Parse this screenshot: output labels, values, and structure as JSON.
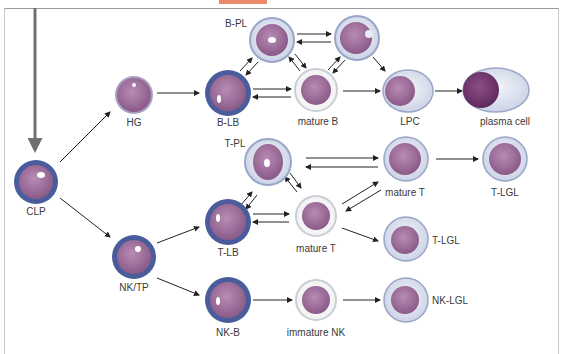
{
  "figure": {
    "accent_color": "#e98a6a",
    "caption_partial": "… B-PL, T-…"
  },
  "cells": {
    "clp": {
      "label": "CLP"
    },
    "hg": {
      "label": "HG"
    },
    "nktp": {
      "label": "NK/TP"
    },
    "b_pl": {
      "label": "B-PL"
    },
    "b_unlabeled": {
      "label": ""
    },
    "b_lb": {
      "label": "B-LB"
    },
    "mature_b": {
      "label": "mature B"
    },
    "lpc": {
      "label": "LPC"
    },
    "plasma_cell": {
      "label": "plasma cell"
    },
    "t_pl": {
      "label": "T-PL"
    },
    "mature_t_upper": {
      "label": "mature T"
    },
    "t_lgl_upper": {
      "label": "T-LGL"
    },
    "t_lb": {
      "label": "T-LB"
    },
    "mature_t_mid": {
      "label": "mature T"
    },
    "t_lgl_mid": {
      "label": "T-LGL"
    },
    "nk_b": {
      "label": "NK-B"
    },
    "immature_nk": {
      "label": "immature NK"
    },
    "nk_lgl": {
      "label": "NK-LGL"
    }
  },
  "colors": {
    "blast_ring": "#4a5c9c",
    "mature_ring": "#c9cdd6",
    "nucleus": "#9c6c98",
    "cytoplasm": "#dfe4f0",
    "arrow": "#222222",
    "main_arrow": "#707070"
  }
}
